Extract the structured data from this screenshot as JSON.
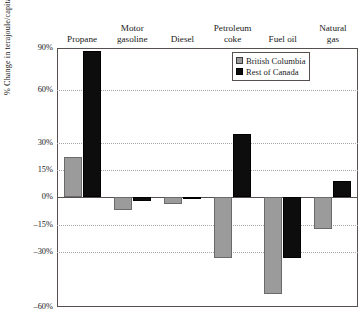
{
  "chart_data": {
    "type": "bar",
    "title": "",
    "xlabel": "",
    "ylabel": "% Change in terajoule/capita",
    "categories": [
      "Propane",
      "Motor gasoline",
      "Diesel",
      "Petroleum coke",
      "Fuel oil",
      "Natural gas"
    ],
    "category_lines": [
      [
        "Propane"
      ],
      [
        "Motor",
        "gasoline"
      ],
      [
        "Diesel"
      ],
      [
        "Petroleum",
        "coke"
      ],
      [
        "Fuel oil"
      ],
      [
        "Natural",
        "gas"
      ]
    ],
    "series": [
      {
        "name": "British Columbia",
        "color": "#9b9b9b",
        "values": [
          22,
          -7,
          -4,
          -33,
          -53,
          -17
        ]
      },
      {
        "name": "Rest of Canada",
        "color": "#0d0d0d",
        "values": [
          88,
          -2,
          -1,
          35,
          -33,
          9
        ]
      }
    ],
    "ytick_labels": [
      "90%",
      "60%",
      "30%",
      "15%",
      "0%",
      "–15%",
      "–30%",
      "–60%"
    ],
    "ytick_values": [
      90,
      60,
      30,
      15,
      0,
      -15,
      -30,
      -60
    ],
    "ylim": [
      -60,
      90
    ],
    "grid": "horizontal-dotted",
    "legend_position": "top-right",
    "axis_note": "non-uniform y scale: 15% steps near zero are compressed relative to 30% steps"
  },
  "legend": {
    "items": [
      {
        "label": "British Columbia",
        "swatch": "bc"
      },
      {
        "label": "Rest of Canada",
        "swatch": "roc"
      }
    ]
  }
}
